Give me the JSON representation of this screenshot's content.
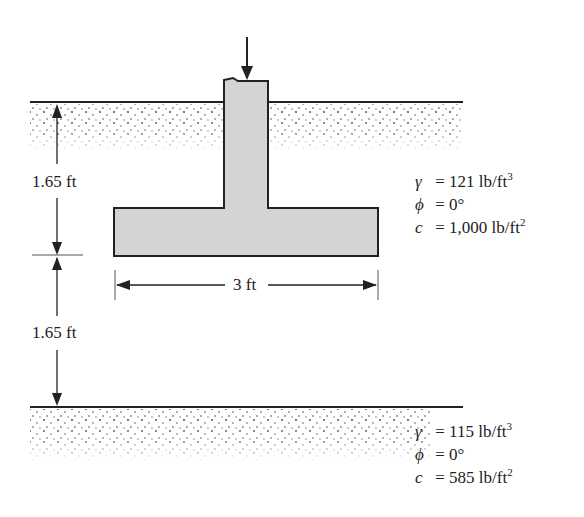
{
  "diagram": {
    "type": "shallow footing on layered clay",
    "load_arrow": "applied vertical load",
    "dimensions": {
      "depth_top": "1.65 ft",
      "depth_bottom": "1.65 ft",
      "width": "3 ft"
    },
    "upper_layer": {
      "gamma_symbol": "γ",
      "gamma": "= 121 lb/ft",
      "gamma_exp": "3",
      "phi_symbol": "ϕ",
      "phi": "= 0°",
      "c_symbol": "c",
      "c": "= 1,000 lb/ft",
      "c_exp": "2"
    },
    "lower_layer": {
      "gamma_symbol": "γ",
      "gamma": "= 115 lb/ft",
      "gamma_exp": "3",
      "phi_symbol": "ϕ",
      "phi": "= 0°",
      "c_symbol": "c",
      "c": "= 585 lb/ft",
      "c_exp": "2"
    },
    "colors": {
      "footing_fill": "#d4d4d4",
      "line": "#222222"
    }
  }
}
